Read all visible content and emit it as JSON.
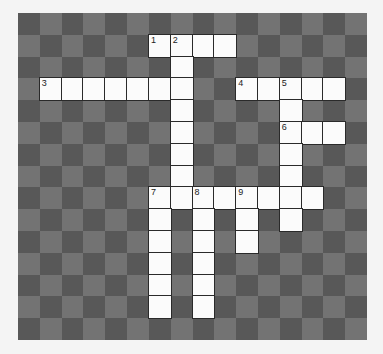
{
  "puzzle": {
    "type": "crossword",
    "rows": 15,
    "cols": 16,
    "colors": {
      "dark_square": "#585858",
      "light_square": "#737373",
      "white_cell": "#fbfbfb",
      "cell_border": "#2a2a2a"
    },
    "entries": [
      {
        "number": "1",
        "direction": "across",
        "row": 1,
        "col": 6,
        "length": 4
      },
      {
        "number": "2",
        "direction": "down",
        "row": 1,
        "col": 7,
        "length": 8
      },
      {
        "number": "3",
        "direction": "across",
        "row": 3,
        "col": 1,
        "length": 7
      },
      {
        "number": "4",
        "direction": "across",
        "row": 3,
        "col": 10,
        "length": 5
      },
      {
        "number": "5",
        "direction": "down",
        "row": 3,
        "col": 12,
        "length": 7
      },
      {
        "number": "6",
        "direction": "across",
        "row": 5,
        "col": 12,
        "length": 3
      },
      {
        "number": "7",
        "direction": "across",
        "row": 8,
        "col": 6,
        "length": 8
      },
      {
        "number": "7",
        "direction": "down",
        "row": 8,
        "col": 6,
        "length": 6
      },
      {
        "number": "8",
        "direction": "down",
        "row": 8,
        "col": 8,
        "length": 6
      },
      {
        "number": "9",
        "direction": "down",
        "row": 8,
        "col": 10,
        "length": 3
      }
    ],
    "cell_values": {}
  }
}
